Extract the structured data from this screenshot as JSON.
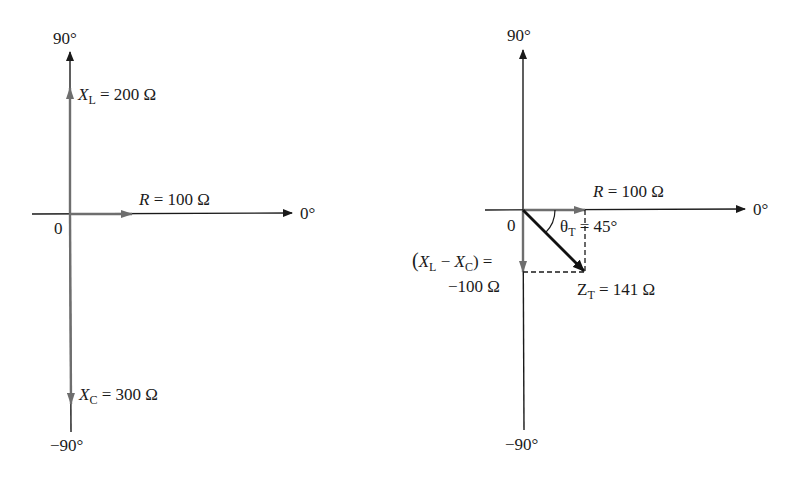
{
  "left_diagram": {
    "axis_labels": {
      "top": "90°",
      "right": "0°",
      "bottom": "−90°",
      "origin": "0"
    },
    "phasors": {
      "xl": {
        "symbol": "X",
        "sub": "L",
        "eq": " = 200 Ω"
      },
      "r": {
        "symbol": "R",
        "eq": " = 100 Ω"
      },
      "xc": {
        "symbol": "X",
        "sub": "C",
        "eq": " = 300 Ω"
      }
    }
  },
  "right_diagram": {
    "axis_labels": {
      "top": "90°",
      "right": "0°",
      "bottom": "−90°",
      "origin": "0"
    },
    "phasors": {
      "r": {
        "symbol": "R",
        "eq": " = 100 Ω"
      },
      "net_x": {
        "open": "(",
        "x1": "X",
        "sub1": "L",
        "minus": " − ",
        "x2": "X",
        "sub2": "C",
        "close": ") =",
        "value": "−100 Ω"
      },
      "theta": {
        "symbol": "θ",
        "sub": "T",
        "eq": " = 45°"
      },
      "zt": {
        "symbol": "Z",
        "sub": "T",
        "eq": " = 141 Ω"
      }
    }
  },
  "colors": {
    "axis": "#1a1a1a",
    "phasor_gray": "#6e6e6e",
    "result": "#111111"
  }
}
